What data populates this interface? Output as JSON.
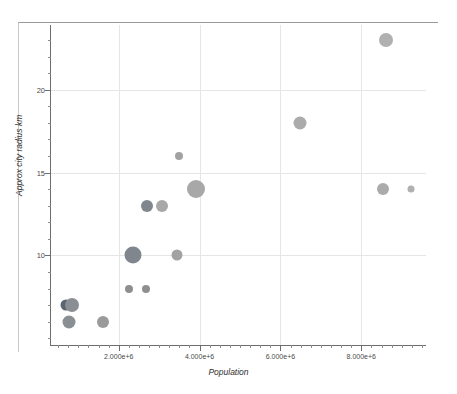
{
  "chart_data": {
    "type": "scatter",
    "title": "",
    "xlabel": "Population",
    "ylabel": "Approx city radius km",
    "xlim": [
      300000,
      9600000
    ],
    "ylim": [
      4.6,
      23.9
    ],
    "grid": true,
    "legend": "none",
    "x_ticks": [
      2000000,
      4000000,
      6000000,
      8000000
    ],
    "x_tick_labels": [
      "2.000e+6",
      "4.000e+6",
      "6.000e+6",
      "8.000e+6"
    ],
    "y_ticks": [
      10,
      15,
      20
    ],
    "y_tick_labels": [
      "10",
      "15",
      "20"
    ],
    "bubble_size_note": "marker area encodes a third variable",
    "points": [
      {
        "x": 700000,
        "y": 7.0,
        "size": 11,
        "color": "#5b6570"
      },
      {
        "x": 850000,
        "y": 7.0,
        "size": 14,
        "color": "#8a8f94"
      },
      {
        "x": 780000,
        "y": 6.0,
        "size": 13,
        "color": "#8a8f94"
      },
      {
        "x": 1620000,
        "y": 6.0,
        "size": 12,
        "color": "#9a9a9a"
      },
      {
        "x": 2250000,
        "y": 8.0,
        "size": 8,
        "color": "#8f8f8f"
      },
      {
        "x": 2680000,
        "y": 8.0,
        "size": 8,
        "color": "#8f8f8f"
      },
      {
        "x": 2350000,
        "y": 10.0,
        "size": 17,
        "color": "#7f868d"
      },
      {
        "x": 3430000,
        "y": 10.0,
        "size": 11,
        "color": "#a2a2a2"
      },
      {
        "x": 2700000,
        "y": 13.0,
        "size": 12,
        "color": "#7f868d"
      },
      {
        "x": 3080000,
        "y": 13.0,
        "size": 12,
        "color": "#a8a8a8"
      },
      {
        "x": 3900000,
        "y": 14.0,
        "size": 18,
        "color": "#a8a8a8"
      },
      {
        "x": 3480000,
        "y": 16.0,
        "size": 8,
        "color": "#a2a2a2"
      },
      {
        "x": 6480000,
        "y": 18.0,
        "size": 13,
        "color": "#ababab"
      },
      {
        "x": 8600000,
        "y": 23.0,
        "size": 14,
        "color": "#b0b0b0"
      },
      {
        "x": 8540000,
        "y": 14.0,
        "size": 12,
        "color": "#ababab"
      },
      {
        "x": 9230000,
        "y": 14.0,
        "size": 7,
        "color": "#b0b0b0"
      }
    ]
  },
  "axes": {
    "x_title": "Population",
    "y_title": "Approx city radius km",
    "x_tick_labels": [
      "2.000e+6",
      "4.000e+6",
      "6.000e+6",
      "8.000e+6"
    ],
    "y_tick_labels": [
      "10",
      "15",
      "20"
    ]
  },
  "colors": {
    "background": "#ffffff",
    "grid": "#e6e6e6",
    "axis": "#6d6d6d",
    "frame": "#c9c9c9",
    "text": "#2e2e2e"
  }
}
